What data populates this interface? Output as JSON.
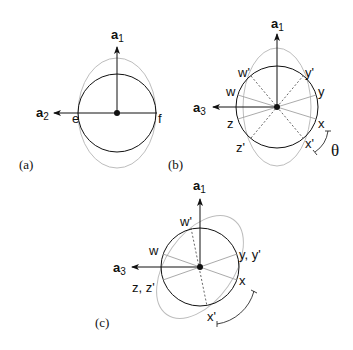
{
  "panels": {
    "a": {
      "caption": "(a)",
      "axis_up": {
        "base": "a",
        "sub": "1"
      },
      "axis_left": {
        "base": "a",
        "sub": "2"
      },
      "points": {
        "e": "e",
        "f": "f"
      }
    },
    "b": {
      "caption": "(b)",
      "axis_up": {
        "base": "a",
        "sub": "1"
      },
      "axis_left": {
        "base": "a",
        "sub": "3"
      },
      "points": {
        "w_prime": "w'",
        "y_prime": "y'",
        "w": "w",
        "y": "y",
        "z": "z",
        "x": "x",
        "z_prime": "z'",
        "x_prime": "x'"
      },
      "angle": "θ"
    },
    "c": {
      "caption": "(c)",
      "axis_up": {
        "base": "a",
        "sub": "1"
      },
      "axis_left": {
        "base": "a",
        "sub": "3"
      },
      "points": {
        "w_prime": "w'",
        "w": "w",
        "y_yp": "y, y'",
        "z_zp": "z, z'",
        "x": "x",
        "x_prime": "x'"
      }
    }
  },
  "colors": {
    "ink": "#111111",
    "ellipse": "#b8b8b8",
    "spoke": "#a0a0a0"
  }
}
